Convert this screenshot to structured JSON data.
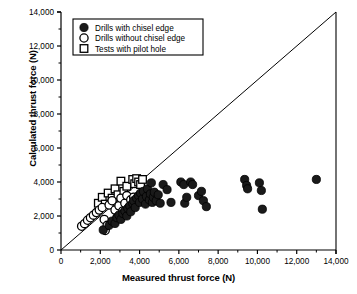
{
  "chart_data": {
    "type": "scatter",
    "title": "",
    "xlabel": "Measured thrust force (N)",
    "ylabel": "Calculated thrust force  (N)",
    "xlim": [
      0,
      14000
    ],
    "ylim": [
      0,
      14000
    ],
    "xticks": [
      0,
      2000,
      4000,
      6000,
      8000,
      10000,
      12000,
      14000
    ],
    "yticks": [
      0,
      2000,
      4000,
      6000,
      8000,
      10000,
      12000,
      14000
    ],
    "xticklabels": [
      "0",
      "2,000",
      "4,000",
      "6,000",
      "8,000",
      "10,000",
      "12,000",
      "14,000"
    ],
    "yticklabels": [
      "0",
      "2,000",
      "4,000",
      "6,000",
      "8,000",
      "10,000",
      "12,000",
      "14,000"
    ],
    "grid": false,
    "minor_ticks": true,
    "reference_line": {
      "name": "one-to-one-line",
      "from": [
        0,
        0
      ],
      "to": [
        14000,
        14000
      ]
    },
    "legend_position": "upper-left",
    "series": [
      {
        "name": "Drills with chisel edge",
        "marker": "filled-circle",
        "color": "#1a1a1a",
        "points": [
          [
            2150,
            1180
          ],
          [
            2450,
            1450
          ],
          [
            2600,
            1700
          ],
          [
            2750,
            1560
          ],
          [
            2850,
            1900
          ],
          [
            2950,
            2050
          ],
          [
            3050,
            1800
          ],
          [
            3150,
            2150
          ],
          [
            3250,
            2300
          ],
          [
            3350,
            2000
          ],
          [
            3400,
            2450
          ],
          [
            3500,
            2600
          ],
          [
            3550,
            2250
          ],
          [
            3650,
            2750
          ],
          [
            3700,
            2900
          ],
          [
            3780,
            2500
          ],
          [
            3850,
            3050
          ],
          [
            3950,
            3200
          ],
          [
            4000,
            2800
          ],
          [
            4050,
            3350
          ],
          [
            4150,
            3000
          ],
          [
            4200,
            3450
          ],
          [
            4300,
            2700
          ],
          [
            4350,
            3150
          ],
          [
            4400,
            3600
          ],
          [
            4500,
            2950
          ],
          [
            4550,
            3300
          ],
          [
            4600,
            3950
          ],
          [
            4650,
            2800
          ],
          [
            4700,
            3100
          ],
          [
            4750,
            3400
          ],
          [
            4850,
            2900
          ],
          [
            4950,
            3250
          ],
          [
            5050,
            2750
          ],
          [
            5200,
            3850
          ],
          [
            5400,
            3550
          ],
          [
            5600,
            2800
          ],
          [
            6100,
            4000
          ],
          [
            6250,
            3850
          ],
          [
            6300,
            2750
          ],
          [
            6400,
            3100
          ],
          [
            6600,
            4000
          ],
          [
            6700,
            3850
          ],
          [
            7000,
            3200
          ],
          [
            7150,
            3450
          ],
          [
            7250,
            2900
          ],
          [
            7400,
            2550
          ],
          [
            9350,
            4150
          ],
          [
            9450,
            3800
          ],
          [
            9500,
            3600
          ],
          [
            10100,
            3950
          ],
          [
            10200,
            3500
          ],
          [
            10250,
            2400
          ],
          [
            13000,
            4150
          ]
        ]
      },
      {
        "name": "Drills without chisel edge",
        "marker": "open-circle",
        "color": "#1a1a1a",
        "points": [
          [
            1050,
            1400
          ],
          [
            1200,
            1550
          ],
          [
            1350,
            1750
          ],
          [
            1500,
            1900
          ],
          [
            1650,
            2050
          ],
          [
            1800,
            2200
          ],
          [
            1950,
            2350
          ],
          [
            2100,
            2500
          ],
          [
            2200,
            1800
          ],
          [
            2250,
            1150
          ],
          [
            2350,
            1450
          ],
          [
            2450,
            2650
          ],
          [
            2600,
            2900
          ],
          [
            2750,
            2350
          ],
          [
            2850,
            1900
          ],
          [
            2950,
            2600
          ],
          [
            3050,
            3050
          ],
          [
            3150,
            2300
          ],
          [
            3250,
            2750
          ],
          [
            3350,
            3200
          ],
          [
            3450,
            2500
          ],
          [
            3550,
            2950
          ],
          [
            3700,
            3100
          ],
          [
            3850,
            2850
          ]
        ]
      },
      {
        "name": "Tests with pilot hole",
        "marker": "open-square",
        "color": "#1a1a1a",
        "points": [
          [
            1900,
            2750
          ],
          [
            2100,
            3100
          ],
          [
            2250,
            2700
          ],
          [
            2400,
            3350
          ],
          [
            2600,
            3050
          ],
          [
            2750,
            3600
          ],
          [
            2900,
            3250
          ],
          [
            3050,
            4050
          ],
          [
            3200,
            3450
          ],
          [
            3350,
            3750
          ],
          [
            3500,
            3050
          ],
          [
            3650,
            4150
          ],
          [
            3750,
            3900
          ],
          [
            3850,
            4200
          ],
          [
            3950,
            4000
          ],
          [
            4050,
            3850
          ],
          [
            4150,
            4150
          ]
        ]
      }
    ]
  },
  "legend": {
    "items": [
      {
        "label": "Drills with chisel edge",
        "marker": "filled-circle"
      },
      {
        "label": "Drills without chisel edge",
        "marker": "open-circle"
      },
      {
        "label": "Tests with pilot hole",
        "marker": "open-square"
      }
    ]
  },
  "axes": {
    "x_label": "Measured thrust force (N)",
    "y_label": "Calculated thrust force  (N)"
  },
  "colors": {
    "axis": "#000000",
    "marker_fill": "#1a1a1a",
    "marker_edge": "#000000",
    "background": "#ffffff"
  }
}
